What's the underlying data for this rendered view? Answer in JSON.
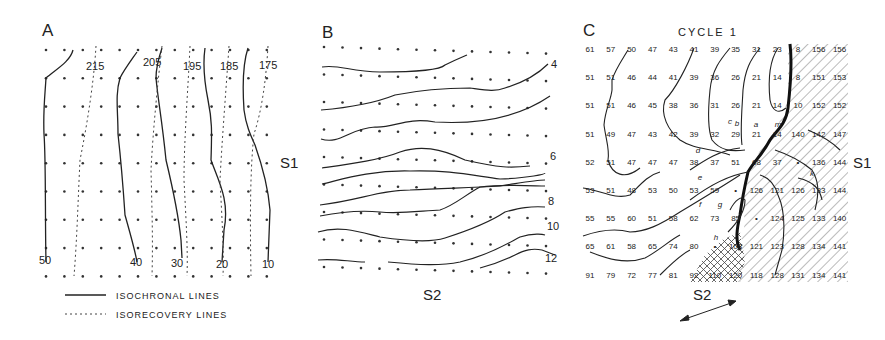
{
  "figure": {
    "panel_a": {
      "letter": "A",
      "isorecovery_labels": [
        "215",
        "205",
        "195",
        "185",
        "175"
      ],
      "isochronal_labels": [
        "50",
        "40",
        "30",
        "20",
        "10"
      ],
      "side_label": "S1",
      "grid": {
        "cols": 13,
        "rows": 9
      }
    },
    "panel_b": {
      "letter": "B",
      "isochronal_labels": [
        "4",
        "6",
        "8",
        "10",
        "12"
      ],
      "bottom_label": "S2",
      "grid": {
        "cols": 13,
        "rows": 9
      }
    },
    "panel_c": {
      "letter": "C",
      "title": "CYCLE 1",
      "side_label": "S1",
      "bottom_label": "S2",
      "values": [
        [
          "61",
          "57",
          "50",
          "47",
          "43",
          "41",
          "39",
          "35",
          "31",
          "23",
          "8",
          "156",
          "156"
        ],
        [
          "51",
          "51",
          "46",
          "44",
          "41",
          "39",
          "36",
          "26",
          "21",
          "14",
          "8",
          "151",
          "153"
        ],
        [
          "51",
          "51",
          "46",
          "45",
          "38",
          "36",
          "31",
          "26",
          "21",
          "14",
          "10",
          "152",
          "152"
        ],
        [
          "51",
          "49",
          "47",
          "43",
          "42",
          "39",
          "32",
          "29",
          "21",
          "14",
          "140",
          "142",
          "147"
        ],
        [
          "52",
          "51",
          "47",
          "47",
          "47",
          "38",
          "37",
          "51",
          "68",
          "37",
          "•",
          "136",
          "144"
        ],
        [
          "53",
          "51",
          "48",
          "53",
          "50",
          "53",
          "59",
          "•",
          "126",
          "121",
          "126",
          "133",
          "144"
        ],
        [
          "55",
          "55",
          "60",
          "51",
          "58",
          "62",
          "73",
          "85",
          "•",
          "124",
          "125",
          "133",
          "140"
        ],
        [
          "65",
          "61",
          "58",
          "65",
          "74",
          "80",
          "•",
          "108",
          "121",
          "123",
          "128",
          "134",
          "141"
        ],
        [
          "91",
          "79",
          "72",
          "77",
          "81",
          "92",
          "110",
          "120",
          "118",
          "128",
          "131",
          "134",
          "141"
        ]
      ],
      "annotations": [
        "a",
        "b",
        "c",
        "d",
        "e",
        "f",
        "g",
        "h",
        "k",
        "m"
      ]
    },
    "legend": {
      "solid_label": "ISOCHRONAL LINES",
      "dashed_label": "ISORECOVERY LINES"
    }
  }
}
